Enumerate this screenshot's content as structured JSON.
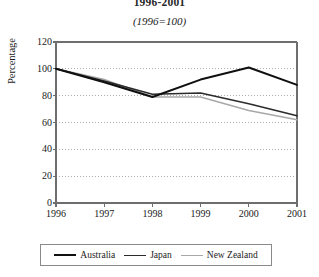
{
  "chart_data": {
    "type": "line",
    "title": "1996-2001",
    "subtitle": "(1996=100)",
    "xlabel": "",
    "ylabel": "Percentage",
    "categories": [
      "1996",
      "1997",
      "1998",
      "1999",
      "2000",
      "2001"
    ],
    "x": [
      1996,
      1997,
      1998,
      1999,
      2000,
      2001
    ],
    "ylim": [
      0,
      120
    ],
    "yticks": [
      0,
      20,
      40,
      60,
      80,
      100,
      120
    ],
    "grid": true,
    "grid_style": "dotted",
    "legend_position": "bottom",
    "series": [
      {
        "name": "Australia",
        "color": "#101010",
        "width": 2.0,
        "values": [
          100,
          90,
          79,
          92,
          101,
          88
        ]
      },
      {
        "name": "Japan",
        "color": "#2b2b2b",
        "width": 1.6,
        "values": [
          100,
          91,
          81,
          82,
          74,
          65
        ]
      },
      {
        "name": "New Zealand",
        "color": "#a8a8a8",
        "width": 1.6,
        "values": [
          100,
          92,
          79,
          79,
          69,
          62
        ]
      }
    ]
  },
  "colors": {
    "axis": "#6e6e6e",
    "grid": "#9a9a9a",
    "text": "#1a1a1a",
    "legend_border": "#8a8a8a",
    "background": "#ffffff"
  }
}
